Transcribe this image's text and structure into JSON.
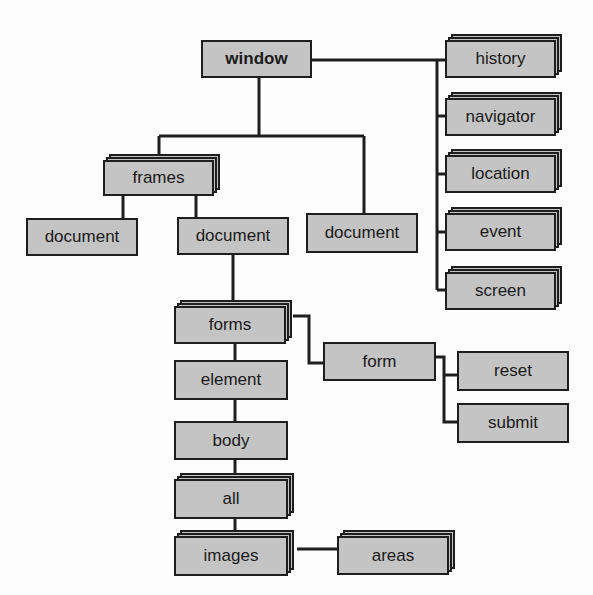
{
  "diagram": {
    "title": "",
    "nodes": [
      {
        "id": "window",
        "label": "window",
        "stacked": false,
        "bold": true
      },
      {
        "id": "history",
        "label": "history",
        "stacked": true,
        "bold": false
      },
      {
        "id": "navigator",
        "label": "navigator",
        "stacked": true,
        "bold": false
      },
      {
        "id": "location",
        "label": "location",
        "stacked": true,
        "bold": false
      },
      {
        "id": "event",
        "label": "event",
        "stacked": true,
        "bold": false
      },
      {
        "id": "screen",
        "label": "screen",
        "stacked": true,
        "bold": false
      },
      {
        "id": "frames",
        "label": "frames",
        "stacked": true,
        "bold": false
      },
      {
        "id": "document_left",
        "label": "document",
        "stacked": false,
        "bold": false
      },
      {
        "id": "document_mid",
        "label": "document",
        "stacked": false,
        "bold": false
      },
      {
        "id": "document_right",
        "label": "document",
        "stacked": false,
        "bold": false
      },
      {
        "id": "forms",
        "label": "forms",
        "stacked": true,
        "bold": false
      },
      {
        "id": "form",
        "label": "form",
        "stacked": false,
        "bold": false
      },
      {
        "id": "reset",
        "label": "reset",
        "stacked": false,
        "bold": false
      },
      {
        "id": "submit",
        "label": "submit",
        "stacked": false,
        "bold": false
      },
      {
        "id": "element",
        "label": "element",
        "stacked": false,
        "bold": false
      },
      {
        "id": "body",
        "label": "body",
        "stacked": false,
        "bold": false
      },
      {
        "id": "all",
        "label": "all",
        "stacked": true,
        "bold": false
      },
      {
        "id": "images",
        "label": "images",
        "stacked": true,
        "bold": false
      },
      {
        "id": "areas",
        "label": "areas",
        "stacked": true,
        "bold": false
      }
    ],
    "edges": [
      [
        "window",
        "history"
      ],
      [
        "window",
        "navigator"
      ],
      [
        "window",
        "location"
      ],
      [
        "window",
        "event"
      ],
      [
        "window",
        "screen"
      ],
      [
        "window",
        "frames"
      ],
      [
        "window",
        "document_right"
      ],
      [
        "frames",
        "document_left"
      ],
      [
        "frames",
        "document_mid"
      ],
      [
        "document_mid",
        "forms"
      ],
      [
        "forms",
        "form"
      ],
      [
        "form",
        "reset"
      ],
      [
        "form",
        "submit"
      ],
      [
        "forms",
        "element"
      ],
      [
        "element",
        "body"
      ],
      [
        "body",
        "all"
      ],
      [
        "all",
        "images"
      ],
      [
        "images",
        "areas"
      ]
    ]
  },
  "colors": {
    "box_fill": "#c4c4c4",
    "box_border": "#1e1e1e",
    "line": "#1e1e1e",
    "background": "#fdfdfd"
  }
}
